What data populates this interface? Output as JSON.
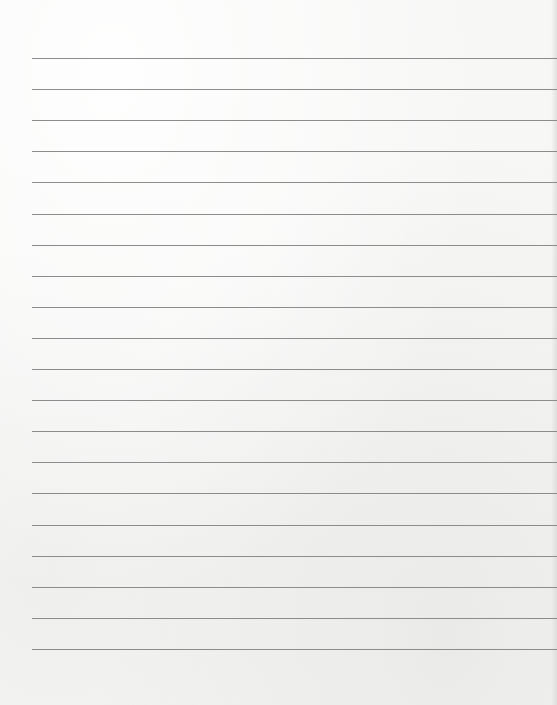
{
  "page": {
    "type": "lined-paper",
    "line_count": 20,
    "first_line_y": 58,
    "line_spacing": 31.1,
    "line_left": 32,
    "line_color": "#8c8c8c",
    "paper_color": "#f7f7f6"
  }
}
